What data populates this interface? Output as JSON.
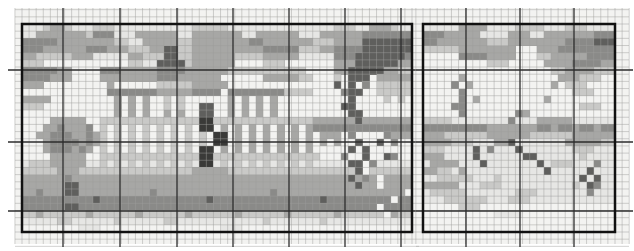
{
  "page": {
    "background": "#ffffff",
    "width": 634,
    "height": 251
  },
  "pattern_chart": {
    "type": "cross-stitch-pixel-pattern",
    "description": "Two-panel grayscale counted cross-stitch chart. Left panel: palace with dome, dark entrance door, colonnade, round tree at left, bare trees at right, horizontal road bands. Right panel: winter field with tree line, bare trees, diagonal branch and dark figure.",
    "palette": {
      ".": "#f3f3f1",
      ",": "#e6e6e4",
      "1": "#c9c9c7",
      "2": "#a7a7a5",
      "3": "#8a8a88",
      "4": "#5f5f5d",
      "5": "#3a3a38"
    },
    "grid_style": {
      "thin_line_color": "#9d9d9b",
      "thin_line_width": 0.55,
      "bold_line_color": "#2d2d2d",
      "bold_line_width": 1.3,
      "border_color": "#111111",
      "border_width": 2.5,
      "paper_color": "#f3f3f1"
    },
    "panels": [
      {
        "name": "left-panel-palace",
        "x": 22,
        "y": 24,
        "cols": 55,
        "rows": 29,
        "cell_w": 7.0909,
        "cell_h": 7.1724,
        "zone": {
          "x0": 15,
          "x1": 419,
          "y0": 8,
          "y1": 244
        },
        "bold_x": [
          63,
          120,
          177,
          233,
          289,
          345,
          401
        ],
        "bold_y": [
          70,
          142,
          211
        ],
        "bold_x_span": {
          "y0": 8,
          "y1": 247
        },
        "bold_y_span": {
          "x0": 8,
          "x1": 419
        },
        "pattern_rows": [
          ",,,1221,,,111,,,,,,,,,,,11111,,,,,,,,,,,,,,,111,,2221,,",
          ",,22222221333,,,222222,,2222222,,222222,,,2222223333333",
          "333332222222211,,22222112222222233222222211122224444444",
          "3332222223332221112244112222222222333331112233334444444",
          "2211111222,,,,,221114411222222111122222,,,,,33344444443",
          "111............11,,44441222222....111.......22244444422",
          "3333322....33322222333322222211111111111....22444442211",
          "3333222....22222222333222222......2222211...1.444.22222",
          "222.........2......1111122222...............4.4.3.11111",
          "............3333333222223333.333333331111....344..11111",
          "2222.........2.2.2..1.1......2.2.2.2..........4....1.1.",
          "111..........2.2.2..1.1..44..2.2.2.2.........44.......",
          ".............2.2.2..2.2..44..2.2.2.2..........44.......",
          "....22222..11111111111111551111111111111122222242222222",
          "...2232223.1.1.1.1.1.1.1.55.2.2.2.2.2.2.233333333333333",
          "..2233322321.1.1.1.1.1.1.1.55.2.2.2.2.2.2.222.3....3222..",
          "...233332321.1.1.1.1.1.1.1.55.2.2.2.2.2.2.2.2..4..4.3....",
          "...2333232.1.1.1.1.1.1.1.55.2.2.2.2.2.2.2.....4.4......",
          "....22222..1111111111111155111111111111111...3..4..43...",
          ",11122222,,1,1,1,1,1,1,1,55,1,1,1,1,1,1,1,,,,,44.3,,,,,",
          "111112221111111111111111222221111111111111111114 1111111",
          "22222232222222222222222222222222222222222222224232 22222",
          "22222244222222222222222222222222222222222222222422 22222",
          "223222442222222222322222222222222223222222222222222222 2",
          "3333333333433333333333333343333333333333334333333333 3333",
          "33333344333333333333333333333333333333333333333333 33333",
          "112111111211111121111112111111211111121111112111111 2111",
          ",,,,,11,,,,,,1,,,,,,11,,,,,,,,,,,,1,,,,,,,1,,,,,,,,,,,,",
          "........,,,.................,,,........................"
        ]
      },
      {
        "name": "right-panel-field",
        "x": 423,
        "y": 24,
        "cols": 27,
        "rows": 29,
        "cell_w": 7.1111,
        "cell_h": 7.1724,
        "zone": {
          "x0": 416,
          "x1": 629,
          "y0": 8,
          "y1": 244
        },
        "bold_x": [
          466,
          520,
          574
        ],
        "bold_y": [
          70,
          142,
          211
        ],
        "bold_x_span": {
          "y0": 8,
          "y1": 247
        },
        "bold_y_span": {
          "x0": 416,
          "x1": 633
        },
        "pattern_rows": [
          ",,,,,2222,,,,1111,,,111,,,,",
          "33322222,,,,222,,2222222333",
          "332222222111222222223333444",
          "1111122222222...22233333333",
          ".....33332222...11222223333",
          ".........111.....2222333322",
          "..................112222111",
          ".....2.............222111..",
          "....3.2...........2.111....",
          ".....3...............111...",
          ".....3.2.........2.........",
          "....33................111..",
          ".....3.......32............",
          "1111,,,,,,,,3,,,22222,,,,,,",
          "333333333222222233233233233",
          "222111111222222111111222222",
          "2222111,,,224,,,,,,,2222211",
          "111,,,,4,3,,,4,,,,,,,111,,,",
          "222,,,,4,,,,,,44,,,,,,1,,,,",
          ",2222,,,4,,,,,,,4,111,,,3,,",
          "2211,2,,,,,,,,,,,4,,,,,4,,,",
          ",,11111,,,1,,,,,,,,,,,4,4,,",
          "22222,,,111,,,,,,,,,,1,43,,",
          ",11111,,,,,,,111,,,,,,,3,,,",
          ",,,111111,,,111,,,,,,,,,,,,",
          ".....111...................",
          "..........,,,,.............",
          "...........................",
          "..........................."
        ]
      }
    ]
  }
}
